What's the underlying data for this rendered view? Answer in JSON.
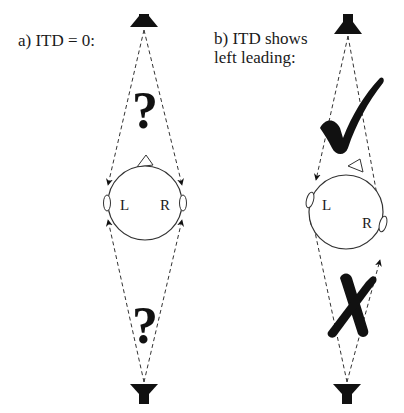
{
  "panels": [
    {
      "id": "a",
      "title": "a) ITD = 0:",
      "title_lines": [
        "a) ITD = 0:"
      ],
      "front_mark": "?",
      "back_mark": "?",
      "ear_labels": {
        "left": "L",
        "right": "R"
      }
    },
    {
      "id": "b",
      "title": "b) ITD shows left leading:",
      "title_lines": [
        "b) ITD shows",
        "left leading:"
      ],
      "front_mark": "check",
      "back_mark": "cross",
      "ear_labels": {
        "left": "L",
        "right": "R"
      }
    }
  ],
  "icons": {
    "speaker": "speaker-icon",
    "question": "question-mark-icon",
    "check": "check-mark-icon",
    "cross": "cross-mark-icon",
    "head": "head-icon"
  },
  "colors": {
    "ink": "#111111",
    "background": "#ffffff",
    "dashed_line": "#333333"
  }
}
